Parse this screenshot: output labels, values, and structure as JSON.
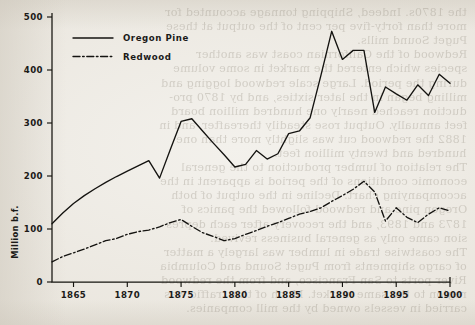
{
  "chart_data": {
    "type": "line",
    "title": "",
    "xlabel": "",
    "ylabel": "Million b.f.",
    "xlim": [
      1863,
      1900
    ],
    "ylim": [
      0,
      500
    ],
    "yticks": [
      0,
      100,
      200,
      300,
      400,
      500
    ],
    "xticks": [
      1865,
      1870,
      1875,
      1880,
      1885,
      1890,
      1895,
      1900
    ],
    "grid": false,
    "legend_position": "upper-left-inside",
    "x": [
      1863,
      1864,
      1865,
      1866,
      1867,
      1868,
      1869,
      1870,
      1871,
      1872,
      1873,
      1874,
      1875,
      1876,
      1877,
      1878,
      1879,
      1880,
      1881,
      1882,
      1883,
      1884,
      1885,
      1886,
      1887,
      1888,
      1889,
      1890,
      1891,
      1892,
      1893,
      1894,
      1895,
      1896,
      1897,
      1898,
      1899,
      1900
    ],
    "series": [
      {
        "name": "Oregon Pine",
        "style": "solid",
        "values": [
          110,
          130,
          148,
          163,
          176,
          188,
          199,
          209,
          219,
          229,
          196,
          250,
          303,
          308,
          285,
          262,
          240,
          217,
          222,
          248,
          232,
          242,
          280,
          285,
          310,
          390,
          473,
          420,
          437,
          437,
          320,
          368,
          355,
          343,
          372,
          352,
          392,
          375
        ]
      },
      {
        "name": "Redwood",
        "style": "dash-dot",
        "values": [
          38,
          48,
          55,
          62,
          70,
          78,
          82,
          90,
          95,
          98,
          104,
          112,
          118,
          105,
          93,
          86,
          78,
          82,
          90,
          97,
          105,
          112,
          120,
          128,
          133,
          140,
          152,
          163,
          175,
          190,
          170,
          115,
          140,
          122,
          112,
          128,
          140,
          134
        ]
      }
    ]
  },
  "legend": {
    "items": [
      {
        "label": "Oregon Pine",
        "style": "solid"
      },
      {
        "label": "Redwood",
        "style": "dash-dot"
      }
    ]
  },
  "axes": {
    "y_axis_title": "Million b.f.",
    "y_tick_labels": [
      "0",
      "100",
      "200",
      "300",
      "400",
      "500"
    ],
    "x_tick_labels": [
      "1865",
      "1870",
      "1875",
      "1880",
      "1885",
      "1890",
      "1895",
      "1900"
    ]
  },
  "background_text": {
    "lines": [
      "the 1870s. Indeed, Shipping tonnage accounted for",
      "more than forty-five per cent of the output at these",
      "Puget Sound mills.",
      "Redwood of the Californian coast was another",
      "species which entered the market in some volume",
      "during the period. Large scale redwood logging and",
      "milling began in the later sixties, and by 1870 pro-",
      "duction reached nearly one hundred million board",
      "feet annually. Output rose steadily thereafter, and in",
      "1882 the redwood cut was slightly more than one",
      "hundred and twenty million feet.",
      "The relation of lumber production to the general",
      "economic conditions of the period is apparent in the",
      "accompanying chart. Decline in the output of both",
      "Oregon pine and redwood followed the panics of",
      "1873 and 1893, and the recovery after each depres-",
      "sion came only as general business revived.",
      "The coastwise trade in lumber was largely a matter",
      "of cargo shipments from Puget Sound and Columbia",
      "River ports to San Francisco, and from the redwood",
      "region to the same market. Much of this traffic was",
      "carried in vessels owned by the mill companies."
    ]
  }
}
